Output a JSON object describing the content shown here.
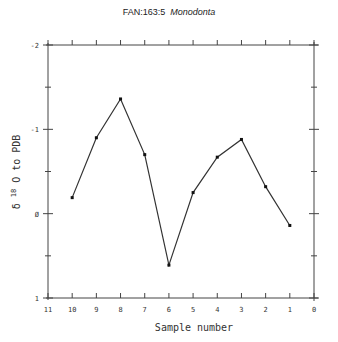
{
  "title": {
    "prefix": "FAN:163:5",
    "species": "Monodonta"
  },
  "chart_data": {
    "type": "line",
    "xlabel": "Sample number",
    "ylabel": "δ 18O to PDB",
    "x": [
      10,
      9,
      8,
      7,
      6,
      5,
      4,
      3,
      2,
      1
    ],
    "values": [
      -0.19,
      -0.9,
      -1.36,
      -0.7,
      0.61,
      -0.25,
      -0.67,
      -0.88,
      -0.32,
      0.14
    ],
    "xlim": [
      11,
      0
    ],
    "ylim": [
      1,
      -2
    ],
    "x_ticks": [
      "11",
      "10",
      "9",
      "8",
      "7",
      "6",
      "5",
      "4",
      "3",
      "2",
      "1",
      "0"
    ],
    "y_ticks": [
      "-2",
      "-1",
      "0",
      "1"
    ],
    "x_reversed": true,
    "y_reversed": true,
    "grid": false,
    "markers": true,
    "line_color": "#333333"
  },
  "axes": {
    "xlabel": "Sample number",
    "ylabel_prefix": "δ",
    "ylabel_sup": "18",
    "ylabel_suffix": "O  to  PDB"
  }
}
